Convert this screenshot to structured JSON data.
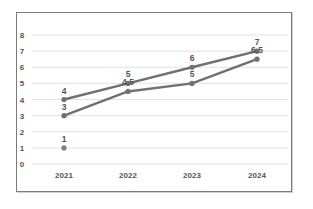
{
  "chart_data": {
    "type": "line",
    "title": "",
    "xlabel": "",
    "ylabel": "",
    "categories": [
      "2021",
      "2022",
      "2023",
      "2024"
    ],
    "y_ticks": [
      "0",
      "1",
      "2",
      "3",
      "4",
      "5",
      "6",
      "7",
      "8"
    ],
    "ylim": [
      0,
      8
    ],
    "grid": true,
    "legend": null,
    "series": [
      {
        "name": "Series 1",
        "values": [
          4,
          5,
          6,
          7
        ],
        "labels": [
          "4",
          "5",
          "6",
          "7"
        ],
        "color": "#707070"
      },
      {
        "name": "Series 2",
        "values": [
          3,
          4.5,
          5,
          6.5
        ],
        "labels": [
          "3",
          "4.5",
          "5",
          "6.5"
        ],
        "color": "#707070"
      },
      {
        "name": "Series 3",
        "values": [
          1,
          null,
          null,
          null
        ],
        "labels": [
          "1",
          "",
          "",
          ""
        ],
        "color": "#808080"
      }
    ]
  }
}
